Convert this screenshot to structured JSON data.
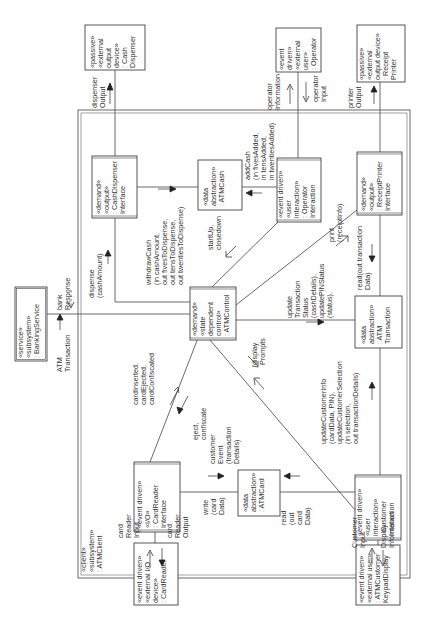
{
  "diagram": {
    "type": "UML communication diagram (rotated 90°)",
    "subsystem": {
      "label_lines": [
        "«client»",
        "«subsystem»",
        ": ATMClient"
      ]
    },
    "objects": {
      "cash_dispenser": {
        "lines": [
          "«passive»",
          "«external",
          "output",
          "device»",
          ": Cash",
          "Dispenser"
        ]
      },
      "operator": {
        "lines": [
          "«event",
          "driven»",
          "«external",
          "user»",
          ": Operator"
        ]
      },
      "receipt_printer": {
        "lines": [
          "«passive»",
          "«external",
          "output device»",
          ": Receipt",
          "Printer"
        ]
      },
      "banking_service": {
        "lines": [
          "«service»",
          "«subsystem»",
          ": BankingService"
        ]
      },
      "card_reader": {
        "lines": [
          "«event driven»",
          "«external I/O",
          "device»",
          ": CardReader"
        ]
      },
      "keypad_display": {
        "lines": [
          "«event driven»",
          "«external user»",
          ": ATMCustomer",
          "KeypadDisplay"
        ]
      },
      "cash_dispenser_interface": {
        "lines": [
          "«demand»",
          "«output»",
          ": CashDispenser",
          "Interface"
        ]
      },
      "atm_cash": {
        "lines": [
          "«data",
          "abstraction»",
          ": ATMCash"
        ]
      },
      "operator_interaction": {
        "lines": [
          "«event driven»",
          "«user",
          "interaction»",
          ": Operator",
          "Interaction"
        ]
      },
      "receipt_printer_interface": {
        "lines": [
          "«demand»",
          "«output»",
          ": ReceiptPrinter",
          "Interface"
        ]
      },
      "atm_control": {
        "lines": [
          "«demand»",
          "«state",
          "dependent",
          "control»",
          ": ATMControl"
        ]
      },
      "atm_transaction": {
        "lines": [
          "«data",
          "abstraction»",
          ": ATM",
          "Transaction"
        ]
      },
      "card_reader_interface": {
        "lines": [
          "«event driven»",
          "«I/O»",
          ": CardReader",
          "Interface"
        ]
      },
      "atm_card": {
        "lines": [
          "«data",
          "abstraction»",
          ": ATMCard"
        ]
      },
      "customer_interaction": {
        "lines": [
          "«event driven»",
          "«user",
          "interaction»",
          ": Customer",
          "Interaction"
        ]
      }
    },
    "messages": {
      "dispenser_output": [
        "dispenser",
        "Output"
      ],
      "operator_information": [
        "operator",
        "Information"
      ],
      "operator_input": [
        "operator",
        "Input"
      ],
      "printer_output": [
        "printer",
        "Output"
      ],
      "bank_response": [
        "bank",
        "Response"
      ],
      "atm_transaction": [
        "ATM",
        "Transaction"
      ],
      "dispense": [
        "dispense",
        "(cashAmount)"
      ],
      "withdraw_cash": [
        "withdrawCash",
        "(in cashAmount,",
        "out fivesToDispense,",
        "out tensToDispense,",
        "out twentiesToDispense)"
      ],
      "add_cash": [
        "addCash",
        "(in fivesAdded,",
        "in tensAdded,",
        "in twentiesAdded)"
      ],
      "startup": [
        "startUp,",
        "closedown"
      ],
      "print": [
        "print",
        "(receiptInfo)"
      ],
      "read_transaction": [
        "read(out transaction",
        "Data)"
      ],
      "update_transaction_status": [
        "update",
        "Transaction",
        "Status",
        "(cashDetails),",
        "updatePINStatus",
        "(status),"
      ],
      "card_events": [
        "cardInserted,",
        "cardEjected,",
        "cardConfiscated"
      ],
      "eject_confiscate": [
        "eject,",
        "confiscate"
      ],
      "customer_event": [
        "customer",
        "Event",
        "(transaction",
        "Details)"
      ],
      "display_prompts": [
        "display",
        "Prompts"
      ],
      "update_customer": [
        "updateCustomerInfo",
        "(cardData, PIN),",
        "updateCustomerSelection",
        "(in selection,",
        "out transactionDetails)"
      ],
      "write_card": [
        "write",
        "(card",
        "Data)"
      ],
      "read_card": [
        "read",
        "(out",
        "card",
        "Data)"
      ],
      "card_reader_input": [
        "card",
        "Reader",
        "Input"
      ],
      "card_reader_output": [
        "card",
        "Reader",
        "Output"
      ],
      "customer_input": [
        "Customer",
        "Input"
      ],
      "display_information": [
        "Display",
        "Information"
      ]
    }
  }
}
